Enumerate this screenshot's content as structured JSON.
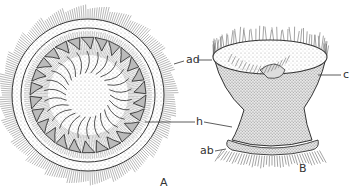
{
  "figure": {
    "panels": [
      {
        "id": "A",
        "label": "A",
        "view": "oral/aboral surface view, circular"
      },
      {
        "id": "B",
        "label": "B",
        "view": "lateral view, bell-shaped"
      }
    ],
    "labels": {
      "ad": "ad",
      "c": "c",
      "h": "h",
      "ab": "ab"
    },
    "colors": {
      "ink": "#333333",
      "background": "#ffffff",
      "stipple": "#bdbdbd"
    }
  }
}
